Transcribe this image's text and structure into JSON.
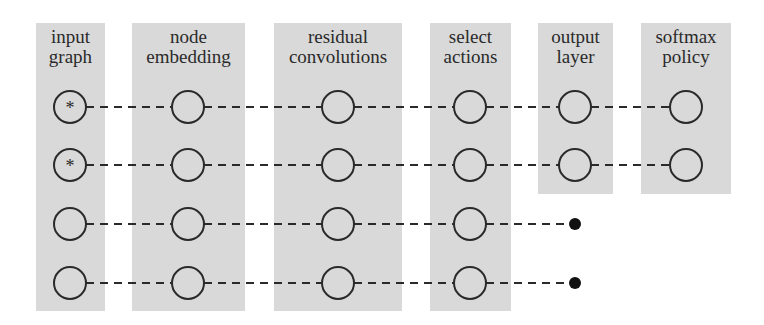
{
  "diagram": {
    "type": "neural-network-pipeline",
    "columns": [
      {
        "id": "input-graph",
        "label_line1": "input",
        "label_line2": "graph",
        "x": 36,
        "width": 69,
        "top": 23,
        "bottom": 311,
        "cx": 70
      },
      {
        "id": "node-embedding",
        "label_line1": "node",
        "label_line2": "embedding",
        "x": 132,
        "width": 113,
        "top": 23,
        "bottom": 311,
        "cx": 188
      },
      {
        "id": "residual-convolutions",
        "label_line1": "residual",
        "label_line2": "convolutions",
        "x": 274,
        "width": 128,
        "top": 23,
        "bottom": 311,
        "cx": 338
      },
      {
        "id": "select-actions",
        "label_line1": "select",
        "label_line2": "actions",
        "x": 430,
        "width": 81,
        "top": 23,
        "bottom": 311,
        "cx": 470
      },
      {
        "id": "output-layer",
        "label_line1": "output",
        "label_line2": "layer",
        "x": 538,
        "width": 75,
        "top": 23,
        "bottom": 194,
        "cx": 575
      },
      {
        "id": "softmax-policy",
        "label_line1": "softmax",
        "label_line2": "policy",
        "x": 641,
        "width": 90,
        "top": 23,
        "bottom": 194,
        "cx": 686
      }
    ],
    "rows": [
      {
        "y": 107,
        "input_marker": "*",
        "extends_to_column": 5,
        "terminal": "circle"
      },
      {
        "y": 165,
        "input_marker": "*",
        "extends_to_column": 5,
        "terminal": "circle"
      },
      {
        "y": 224,
        "input_marker": "",
        "extends_to_column": 3,
        "terminal": "dot",
        "dot_x": 575
      },
      {
        "y": 283,
        "input_marker": "",
        "extends_to_column": 3,
        "terminal": "dot",
        "dot_x": 575
      }
    ],
    "node_radius": 16,
    "colors": {
      "column_fill": "#d9d9d9",
      "stroke": "#2a2a2a",
      "background": "#ffffff"
    }
  }
}
